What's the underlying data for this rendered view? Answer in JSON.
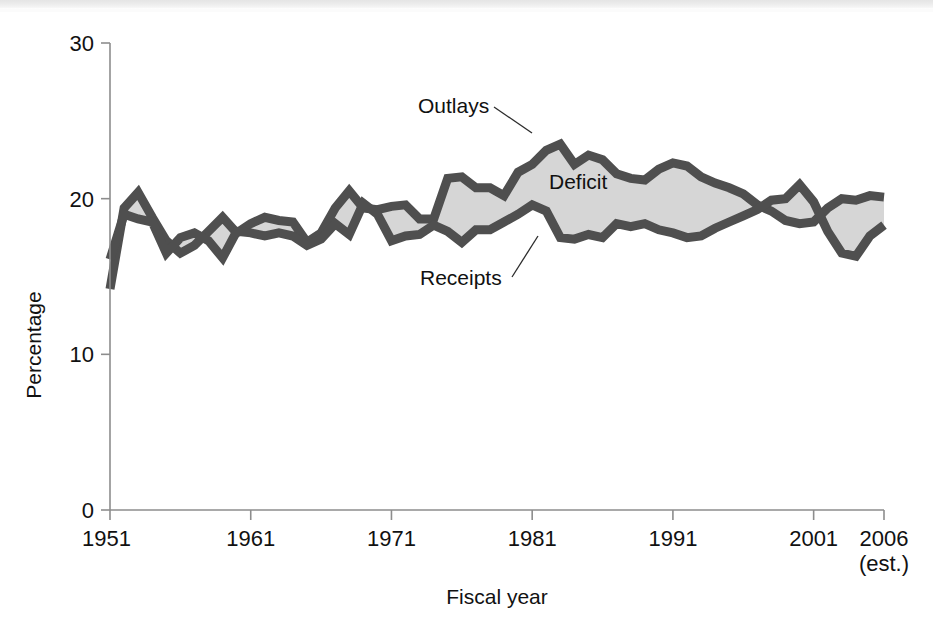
{
  "figure": {
    "background_color": "#ffffff",
    "has_scan_artifact_strip": true
  },
  "chart_data": {
    "type": "area",
    "title": "",
    "subtitle": "",
    "xlabel": "Fiscal year",
    "ylabel": "Percentage",
    "xlim": [
      1951,
      2006
    ],
    "ylim": [
      0,
      30
    ],
    "grid": false,
    "legend_position": "inline-annotations",
    "x_tick_labels": [
      "1951",
      "1961",
      "1971",
      "1981",
      "1991",
      "2001",
      "2006"
    ],
    "x_tick_values": [
      1951,
      1961,
      1971,
      1981,
      1991,
      2001,
      2006
    ],
    "x_tick_sublabel": "(est.)",
    "y_tick_labels": [
      "0",
      "10",
      "20",
      "30"
    ],
    "y_tick_values": [
      0,
      10,
      20,
      30
    ],
    "colors": {
      "line": "#4f4f4f",
      "fill": "#d6d6d6",
      "axis": "#8d8d8d",
      "text": "#111111"
    },
    "annotations": [
      {
        "name": "outlays-label",
        "text": "Outlays",
        "x_px": 418,
        "y_px": 113,
        "leader_to_x": 532,
        "leader_to_y": 133
      },
      {
        "name": "deficit-label",
        "text": "Deficit",
        "x_px": 549,
        "y_px": 189,
        "leader_to_x": null,
        "leader_to_y": null
      },
      {
        "name": "receipts-label",
        "text": "Receipts",
        "x_px": 420,
        "y_px": 285,
        "leader_to_x": 538,
        "leader_to_y": 236
      }
    ],
    "x": [
      1951,
      1952,
      1953,
      1954,
      1955,
      1956,
      1957,
      1958,
      1959,
      1960,
      1961,
      1962,
      1963,
      1964,
      1965,
      1966,
      1967,
      1968,
      1969,
      1970,
      1971,
      1972,
      1973,
      1974,
      1975,
      1976,
      1977,
      1978,
      1979,
      1980,
      1981,
      1982,
      1983,
      1984,
      1985,
      1986,
      1987,
      1988,
      1989,
      1990,
      1991,
      1992,
      1993,
      1994,
      1995,
      1996,
      1997,
      1998,
      1999,
      2000,
      2001,
      2002,
      2003,
      2004,
      2005,
      2006
    ],
    "series": [
      {
        "name": "Outlays",
        "label": "Outlays",
        "values": [
          14.2,
          19.4,
          20.4,
          18.8,
          17.3,
          16.5,
          17.0,
          17.9,
          18.8,
          17.8,
          18.4,
          18.8,
          18.6,
          18.5,
          17.2,
          17.8,
          19.4,
          20.5,
          19.4,
          19.3,
          19.5,
          19.6,
          18.7,
          18.7,
          21.3,
          21.4,
          20.7,
          20.7,
          20.2,
          21.7,
          22.2,
          23.1,
          23.5,
          22.2,
          22.8,
          22.5,
          21.6,
          21.3,
          21.2,
          21.9,
          22.3,
          22.1,
          21.4,
          21.0,
          20.7,
          20.3,
          19.6,
          19.2,
          18.6,
          18.4,
          18.5,
          19.4,
          20.0,
          19.9,
          20.2,
          20.1
        ]
      },
      {
        "name": "Receipts",
        "label": "Receipts",
        "values": [
          16.1,
          19.0,
          18.7,
          18.5,
          16.5,
          17.5,
          17.8,
          17.3,
          16.2,
          17.9,
          17.8,
          17.6,
          17.8,
          17.6,
          17.0,
          17.4,
          18.4,
          17.7,
          19.7,
          19.0,
          17.3,
          17.6,
          17.7,
          18.3,
          17.9,
          17.2,
          18.0,
          18.0,
          18.5,
          19.0,
          19.6,
          19.2,
          17.5,
          17.4,
          17.7,
          17.5,
          18.4,
          18.2,
          18.4,
          18.0,
          17.8,
          17.5,
          17.6,
          18.1,
          18.5,
          18.9,
          19.3,
          19.9,
          20.0,
          20.9,
          19.8,
          17.9,
          16.5,
          16.3,
          17.6,
          18.3
        ]
      }
    ],
    "shaded_region": {
      "name": "Deficit",
      "label": "Deficit",
      "description": "Area between Outlays (upper) and Receipts (lower); shaded gray"
    }
  },
  "axes": {
    "y_axis_label": "Percentage",
    "x_axis_label": "Fiscal year"
  }
}
